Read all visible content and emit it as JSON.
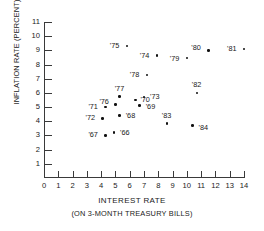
{
  "chart_data": {
    "type": "scatter",
    "title": "",
    "xlabel": "INTEREST RATE",
    "xsublabel": "(ON 3-MONTH  TREASURY BILLS)",
    "ylabel": "INFLATION RATE (PERCENT)",
    "xlim": [
      0,
      14
    ],
    "ylim": [
      0,
      11
    ],
    "grid": false,
    "legend": "none",
    "xticks": [
      "0",
      "1",
      "2",
      "3",
      "4",
      "5",
      "6",
      "7",
      "8",
      "9",
      "10",
      "11",
      "12",
      "13",
      "14"
    ],
    "yticks": [
      "1",
      "2",
      "3",
      "4",
      "5",
      "6",
      "7",
      "8",
      "9",
      "10",
      "11"
    ],
    "point_color": "#111111",
    "axis_color": "#3a3a3a",
    "points": [
      {
        "label": "'66",
        "x": 4.9,
        "y": 3.2,
        "lx": 6,
        "ly": -4
      },
      {
        "label": "'67",
        "x": 4.3,
        "y": 3.0,
        "lx": -17,
        "ly": -4
      },
      {
        "label": "'68",
        "x": 5.3,
        "y": 4.4,
        "lx": 6,
        "ly": -4
      },
      {
        "label": "'69",
        "x": 6.7,
        "y": 5.1,
        "lx": 6,
        "ly": -3
      },
      {
        "label": "'70",
        "x": 6.4,
        "y": 5.5,
        "lx": 5,
        "ly": -4
      },
      {
        "label": "'71",
        "x": 4.3,
        "y": 5.0,
        "lx": -17,
        "ly": -4
      },
      {
        "label": "'72",
        "x": 4.1,
        "y": 4.2,
        "lx": -17,
        "ly": -4
      },
      {
        "label": "'73",
        "x": 7.0,
        "y": 5.7,
        "lx": 6,
        "ly": -4
      },
      {
        "label": "'74",
        "x": 7.9,
        "y": 8.65,
        "lx": -17,
        "ly": -3
      },
      {
        "label": "'75",
        "x": 5.8,
        "y": 9.3,
        "lx": -17,
        "ly": -4
      },
      {
        "label": "'76",
        "x": 5.0,
        "y": 5.2,
        "lx": -16,
        "ly": -6
      },
      {
        "label": "'77",
        "x": 5.3,
        "y": 5.75,
        "lx": -5,
        "ly": -11
      },
      {
        "label": "'78",
        "x": 7.2,
        "y": 7.25,
        "lx": -17,
        "ly": -4
      },
      {
        "label": "'79",
        "x": 10.0,
        "y": 8.45,
        "lx": -17,
        "ly": -3
      },
      {
        "label": "'80",
        "x": 11.5,
        "y": 9.0,
        "lx": -17,
        "ly": -6
      },
      {
        "label": "'81",
        "x": 14.0,
        "y": 9.1,
        "lx": -17,
        "ly": -4
      },
      {
        "label": "'82",
        "x": 10.7,
        "y": 6.0,
        "lx": -5,
        "ly": -12
      },
      {
        "label": "'83",
        "x": 8.6,
        "y": 3.85,
        "lx": -5,
        "ly": -11
      },
      {
        "label": "'84",
        "x": 10.4,
        "y": 3.7,
        "lx": 6,
        "ly": -2
      }
    ]
  }
}
